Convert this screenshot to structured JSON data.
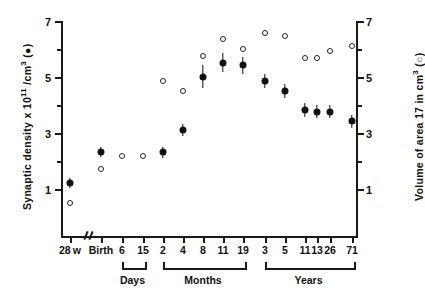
{
  "chart_data": {
    "type": "scatter",
    "title": "",
    "xlabel": "",
    "ylabel": "Synaptic density x 10",
    "ylabel_exp": "11",
    "ylabel_tail": "/cm",
    "ylabel_tail_exp": "3",
    "ylabel_marker": "(●)",
    "y2label": "Volume of area 17 in cm",
    "y2label_exp": "3",
    "y2label_marker": "(○)",
    "ylim": [
      0,
      7
    ],
    "y2lim": [
      0,
      7
    ],
    "yticks": [
      1,
      3,
      5,
      7
    ],
    "yticks_minor": [
      2,
      4,
      6
    ],
    "y2ticks": [
      1,
      3,
      5,
      7
    ],
    "grid": false,
    "legend": "inline-axis-markers",
    "axis_break_after": "28w",
    "categories": [
      "28w",
      "Birth",
      "6",
      "15",
      "2",
      "4",
      "8",
      "11",
      "19",
      "3",
      "5",
      "11",
      "13",
      "26",
      "71"
    ],
    "groups": [
      {
        "label": "Days",
        "from": "6",
        "to": "15"
      },
      {
        "label": "Months",
        "from": "2",
        "to": "19"
      },
      {
        "label": "Years",
        "from": "3",
        "to": "71"
      }
    ],
    "series": [
      {
        "name": "Synaptic density x 10^11 /cm3",
        "marker": "filled-circle",
        "axis": "left",
        "values": [
          1.25,
          2.35,
          null,
          null,
          2.35,
          3.15,
          5.05,
          5.55,
          5.45,
          4.9,
          4.55,
          3.85,
          3.8,
          3.8,
          3.45
        ],
        "errors": [
          0.17,
          0.17,
          null,
          null,
          0.2,
          0.22,
          0.4,
          0.33,
          0.3,
          0.25,
          0.25,
          0.25,
          0.22,
          0.22,
          0.22
        ]
      },
      {
        "name": "Volume of area 17 in cm3",
        "marker": "open-circle",
        "axis": "right",
        "values": [
          0.55,
          1.75,
          2.2,
          2.2,
          4.9,
          4.55,
          5.8,
          6.4,
          6.05,
          6.6,
          6.5,
          5.7,
          5.7,
          5.95,
          6.15
        ],
        "errors": [
          null,
          null,
          null,
          null,
          null,
          null,
          null,
          null,
          null,
          null,
          null,
          null,
          null,
          null,
          null
        ]
      }
    ]
  },
  "axis": {
    "left_title_parts": {
      "a": "Synaptic density x 10",
      "b": "11",
      "c": " /cm",
      "d": "3",
      "e": "  (●)"
    },
    "right_title_parts": {
      "a": "Volume of area 17 in cm",
      "b": "3",
      "c": "  (○)"
    }
  }
}
